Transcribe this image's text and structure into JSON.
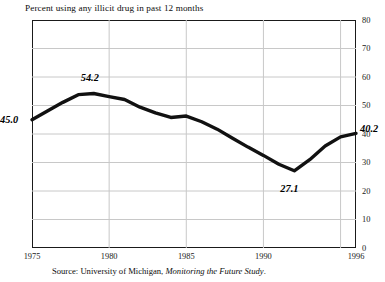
{
  "chart_data": {
    "type": "line",
    "title": "Percent using any illicit drug in past 12 months",
    "xlabel": "",
    "ylabel": "",
    "xlim": [
      1975,
      1996
    ],
    "ylim": [
      0,
      80
    ],
    "grid": "both",
    "legend": "none",
    "x": [
      1975,
      1976,
      1977,
      1978,
      1979,
      1980,
      1981,
      1982,
      1983,
      1984,
      1985,
      1986,
      1987,
      1988,
      1989,
      1990,
      1991,
      1992,
      1993,
      1994,
      1995,
      1996
    ],
    "series": [
      {
        "name": "Percent using any illicit drug in past 12 months",
        "values": [
          45.0,
          48.1,
          51.1,
          53.8,
          54.2,
          53.1,
          52.1,
          49.4,
          47.4,
          45.8,
          46.3,
          44.3,
          41.7,
          38.5,
          35.4,
          32.5,
          29.4,
          27.1,
          31.0,
          35.8,
          39.0,
          40.2
        ]
      }
    ],
    "y_ticks": [
      0,
      10,
      20,
      30,
      40,
      50,
      60,
      70,
      80
    ],
    "x_ticks": [
      {
        "value": 1975,
        "label": "1975"
      },
      {
        "value": 1980,
        "label": "1980"
      },
      {
        "value": 1985,
        "label": "1985"
      },
      {
        "value": 1990,
        "label": "1990"
      },
      {
        "value": 1996,
        "label": "1996"
      }
    ],
    "gridlines_x": [
      1980,
      1985,
      1990,
      1995
    ],
    "annotations": [
      {
        "label": "45.0",
        "x": 1975,
        "y": 45.0,
        "position": "left"
      },
      {
        "label": "54.2",
        "x": 1979,
        "y": 54.2,
        "position": "above"
      },
      {
        "label": "27.1",
        "x": 1992,
        "y": 27.1,
        "position": "below"
      },
      {
        "label": "40.2",
        "x": 1996,
        "y": 40.2,
        "position": "right"
      }
    ],
    "line_color": "#111111",
    "grid_color": "#c8c8c8"
  },
  "source": {
    "prefix": "Source: University of Michigan, ",
    "italic": "Monitoring the Future Study",
    "suffix": "."
  }
}
